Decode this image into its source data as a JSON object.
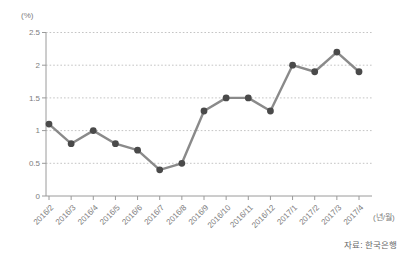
{
  "chart_data": {
    "type": "line",
    "categories": [
      "2016/2",
      "2016/3",
      "2016/4",
      "2016/5",
      "2016/6",
      "2016/7",
      "2016/8",
      "2016/9",
      "2016/10",
      "2016/11",
      "2016/12",
      "2017/1",
      "2017/2",
      "2017/3",
      "2017/4"
    ],
    "values": [
      1.1,
      0.8,
      1.0,
      0.8,
      0.7,
      0.4,
      0.5,
      1.3,
      1.5,
      1.5,
      1.3,
      2.0,
      1.9,
      2.2,
      1.9
    ],
    "ylabel": "(%)",
    "xlabel": "(년/월)",
    "source": "자료: 한국은행",
    "ylim": [
      0,
      2.5
    ],
    "yticks": [
      0,
      0.5,
      1,
      1.5,
      2,
      2.5
    ],
    "grid": true,
    "gridline_style": "dotted",
    "legend": false,
    "marker": "circle",
    "x_tick_rotation_deg": -45,
    "colors": {
      "line": "#8a8a8a",
      "marker": "#4a4a4a",
      "grid": "#c4c4c4",
      "axis": "#9a9a9a",
      "tick_label": "#7d7d7d",
      "source_text": "#666666",
      "background": "#ffffff"
    }
  }
}
